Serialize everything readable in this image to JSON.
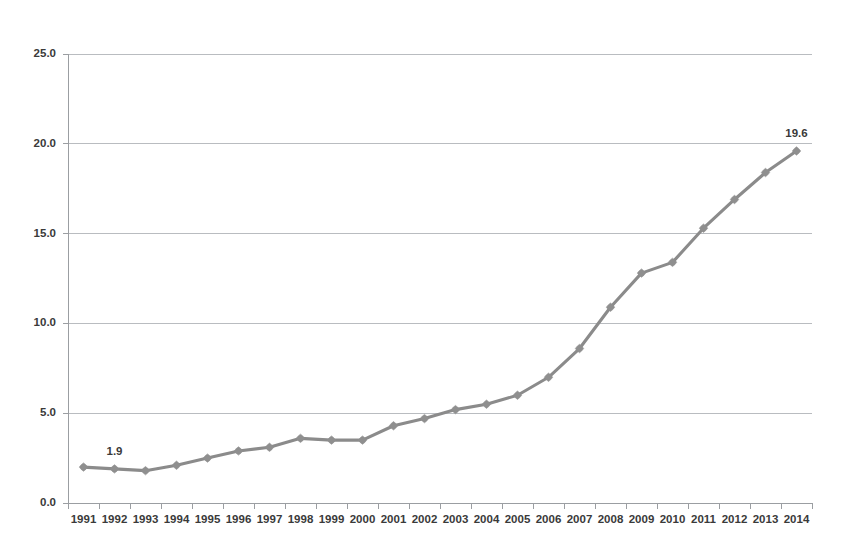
{
  "chart_data": {
    "type": "line",
    "title": "",
    "subtitle": "",
    "xlabel": "",
    "ylabel": "",
    "legend": [],
    "legend_position": "none",
    "grid": true,
    "categories": [
      "1991",
      "1992",
      "1993",
      "1994",
      "1995",
      "1996",
      "1997",
      "1998",
      "1999",
      "2000",
      "2001",
      "2002",
      "2003",
      "2004",
      "2005",
      "2006",
      "2007",
      "2008",
      "2009",
      "2010",
      "2011",
      "2012",
      "2013",
      "2014"
    ],
    "values": [
      2.0,
      1.9,
      1.8,
      2.1,
      2.5,
      2.9,
      3.1,
      3.6,
      3.5,
      3.5,
      4.3,
      4.7,
      5.2,
      5.5,
      6.0,
      7.0,
      8.6,
      10.9,
      12.8,
      13.4,
      15.3,
      16.9,
      18.4,
      19.6
    ],
    "series": [
      {
        "name": "series-1",
        "values": [
          2.0,
          1.9,
          1.8,
          2.1,
          2.5,
          2.9,
          3.1,
          3.6,
          3.5,
          3.5,
          4.3,
          4.7,
          5.2,
          5.5,
          6.0,
          7.0,
          8.6,
          10.9,
          12.8,
          13.4,
          15.3,
          16.9,
          18.4,
          19.6
        ],
        "color": "#8b8b8b"
      }
    ],
    "ylim": [
      0.0,
      25.0
    ],
    "yticks": [
      0.0,
      5.0,
      10.0,
      15.0,
      20.0,
      25.0
    ],
    "ytick_labels": [
      "0.0",
      "5.0",
      "10.0",
      "15.0",
      "20.0",
      "25.0"
    ],
    "xtick_labels": [
      "1991",
      "1992",
      "1993",
      "1994",
      "1995",
      "1996",
      "1997",
      "1998",
      "1999",
      "2000",
      "2001",
      "2002",
      "2003",
      "2004",
      "2005",
      "2006",
      "2007",
      "2008",
      "2009",
      "2010",
      "2011",
      "2012",
      "2013",
      "2014"
    ],
    "annotations": [
      {
        "text": "1.9",
        "category": "1992",
        "value": 1.9
      },
      {
        "text": "19.6",
        "category": "2014",
        "value": 19.6
      }
    ],
    "colors": {
      "line": "#8b8b8b",
      "marker": "#8f8f8f",
      "gridline": "#b9bcc0",
      "axis": "#9b9ea2",
      "text": "#3a3a3a",
      "background": "#ffffff"
    }
  }
}
